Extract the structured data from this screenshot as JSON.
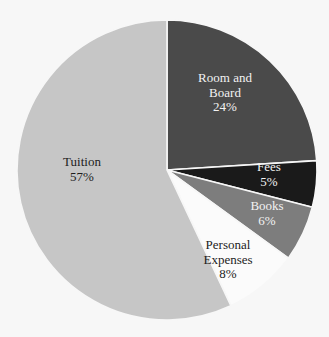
{
  "chart_data": {
    "type": "pie",
    "title": "",
    "subtitle": "",
    "xlabel": "",
    "ylabel": "",
    "legend": "none",
    "labels_inside_slices": true,
    "start_angle_deg": 0,
    "direction": "clockwise",
    "categories": [
      "Room and Board",
      "Fees",
      "Books",
      "Personal Expenses",
      "Tuition"
    ],
    "values": [
      24,
      5,
      6,
      8,
      57
    ],
    "value_unit": "%",
    "slices": [
      {
        "name": "Room and Board",
        "value": 24,
        "value_text": "24%",
        "color": "#4a4a4a",
        "label_color": "light",
        "label_line1": "Room and",
        "label_line2": "Board"
      },
      {
        "name": "Fees",
        "value": 5,
        "value_text": "5%",
        "color": "#1a1a1a",
        "label_color": "light",
        "label_line1": "Fees",
        "label_line2": ""
      },
      {
        "name": "Books",
        "value": 6,
        "value_text": "6%",
        "color": "#7d7d7d",
        "label_color": "light",
        "label_line1": "Books",
        "label_line2": ""
      },
      {
        "name": "Personal Expenses",
        "value": 8,
        "value_text": "8%",
        "color": "#fbfbfb",
        "label_color": "dark",
        "label_line1": "Personal",
        "label_line2": "Expenses"
      },
      {
        "name": "Tuition",
        "value": 57,
        "value_text": "57%",
        "color": "#c6c6c6",
        "label_color": "dark",
        "label_line1": "Tuition",
        "label_line2": ""
      }
    ],
    "total": 100,
    "background_color": "#f7f7f7",
    "separator_color": "#f7f7f7"
  },
  "geometry": {
    "center_x": 167,
    "center_y": 170,
    "radius": 150
  }
}
